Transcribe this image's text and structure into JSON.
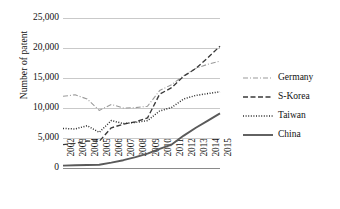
{
  "chart_data": {
    "type": "line",
    "title": "",
    "xlabel": "",
    "ylabel": "Number of patent",
    "x": [
      "2002",
      "2003",
      "2004",
      "2005",
      "2006",
      "2007",
      "2008",
      "2009",
      "2010",
      "2011",
      "2012",
      "2013",
      "2014",
      "2015"
    ],
    "ylim": [
      0,
      25000
    ],
    "ytick_labels": [
      "0",
      "5,000",
      "10,000",
      "15,000",
      "20,000",
      "25,000"
    ],
    "ytick_values": [
      0,
      5000,
      10000,
      15000,
      20000,
      25000
    ],
    "grid": "horizontal",
    "legend_position": "right",
    "series": [
      {
        "name": "Germany",
        "style": "dash-dot",
        "color": "#9a9a9a",
        "values": [
          11950,
          12200,
          11500,
          9600,
          10600,
          10000,
          10050,
          10300,
          12900,
          13900,
          15400,
          16600,
          17300,
          17800
        ]
      },
      {
        "name": "S-Korea",
        "style": "dashed",
        "color": "#3a3a3a",
        "values": [
          3900,
          4100,
          4500,
          4450,
          6700,
          7300,
          7700,
          8350,
          12300,
          13400,
          15300,
          16600,
          18400,
          20300
        ]
      },
      {
        "name": "Taiwan",
        "style": "dotted",
        "color": "#2b2b2b",
        "values": [
          6600,
          6500,
          7050,
          5950,
          7900,
          7400,
          7600,
          7900,
          9500,
          10100,
          11500,
          12100,
          12400,
          12700
        ]
      },
      {
        "name": "China",
        "style": "solid",
        "color": "#5a5a5a",
        "values": [
          400,
          450,
          500,
          550,
          900,
          1300,
          1800,
          2400,
          3200,
          3900,
          5400,
          6700,
          7900,
          9100
        ]
      }
    ]
  },
  "legend": {
    "items": [
      {
        "label": "Germany"
      },
      {
        "label": "S-Korea"
      },
      {
        "label": "Taiwan"
      },
      {
        "label": "China"
      }
    ]
  }
}
